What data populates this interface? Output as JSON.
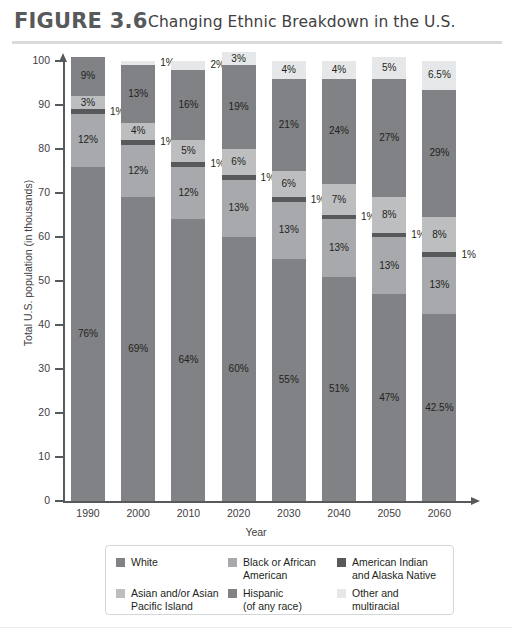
{
  "figure": {
    "number_label": "FIGURE 3.6",
    "title": "Changing Ethnic Breakdown in the U.S."
  },
  "chart_data": {
    "type": "bar",
    "subtype": "stacked-bar",
    "title": "Changing Ethnic Breakdown in the U.S.",
    "xlabel": "Year",
    "ylabel": "Total U.S. population (in thousands)",
    "categories": [
      "1990",
      "2000",
      "2010",
      "2020",
      "2030",
      "2040",
      "2050",
      "2060"
    ],
    "ylim": [
      0,
      100
    ],
    "yticks": [
      0,
      10,
      20,
      30,
      40,
      50,
      60,
      70,
      80,
      90,
      100
    ],
    "ytick_labels": [
      "0",
      "10",
      "20",
      "30",
      "40",
      "50",
      "60",
      "70",
      "80",
      "90",
      "100"
    ],
    "grid": false,
    "legend_position": "bottom",
    "stack_order_bottom_to_top": [
      "White",
      "Black or African American",
      "American Indian and Alaska Native",
      "Asian and/or Asian Pacific Island",
      "Hispanic (of any race)",
      "Other and multiracial"
    ],
    "series": [
      {
        "name": "White",
        "color": "#808285",
        "values": [
          76,
          69,
          64,
          60,
          55,
          51,
          47,
          42.5
        ],
        "labels": [
          "76%",
          "69%",
          "64%",
          "60%",
          "55%",
          "51%",
          "47%",
          "42.5%"
        ]
      },
      {
        "name": "Black or African American",
        "color": "#a7a9ac",
        "values": [
          12,
          12,
          12,
          13,
          13,
          13,
          13,
          13
        ],
        "labels": [
          "12%",
          "12%",
          "12%",
          "13%",
          "13%",
          "13%",
          "13%",
          "13%"
        ]
      },
      {
        "name": "American Indian and Alaska Native",
        "color": "#58595b",
        "values": [
          1,
          1,
          1,
          1,
          1,
          1,
          1,
          1
        ],
        "labels": [
          "1%",
          "1%",
          "1%",
          "1%",
          "1%",
          "1%",
          "1%",
          "1%"
        ]
      },
      {
        "name": "Asian and/or Asian Pacific Island",
        "color": "#bcbec0",
        "values": [
          3,
          4,
          5,
          6,
          6,
          7,
          8,
          8
        ],
        "labels": [
          "3%",
          "4%",
          "5%",
          "6%",
          "6%",
          "7%",
          "8%",
          "8%"
        ]
      },
      {
        "name": "Hispanic (of any race)",
        "color": "#808285",
        "values": [
          9,
          13,
          16,
          19,
          21,
          24,
          27,
          29
        ],
        "labels": [
          "9%",
          "13%",
          "16%",
          "19%",
          "21%",
          "24%",
          "27%",
          "29%"
        ]
      },
      {
        "name": "Other and multiracial",
        "color": "#e6e7e8",
        "values": [
          0,
          1,
          2,
          3,
          4,
          4,
          5,
          6.5
        ],
        "labels": [
          "",
          "1%",
          "2%",
          "3%",
          "4%",
          "4%",
          "5%",
          "6.5%"
        ]
      }
    ]
  },
  "legend": {
    "entries": [
      {
        "label": "White",
        "color": "#808285"
      },
      {
        "label": "Black or African\nAmerican",
        "color": "#a7a9ac"
      },
      {
        "label": "American Indian\nand Alaska Native",
        "color": "#58595b"
      },
      {
        "label": "Asian and/or Asian\nPacific Island",
        "color": "#bcbec0"
      },
      {
        "label": "Hispanic\n(of any race)",
        "color": "#808285"
      },
      {
        "label": "Other and\nmultiracial",
        "color": "#e6e7e8"
      }
    ]
  },
  "colors": {
    "axis": "#58595b",
    "header_rule": "#d9dadb",
    "figure_number": "#58595b",
    "title_text": "#414042"
  }
}
